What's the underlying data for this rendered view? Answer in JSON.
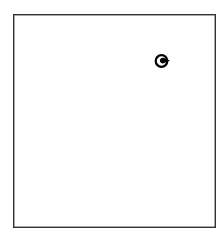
{
  "canvas": {
    "border_color": "#333333",
    "background": "#ffffff"
  },
  "icon": {
    "name": "circle-arrow-icon",
    "color": "#000000"
  }
}
